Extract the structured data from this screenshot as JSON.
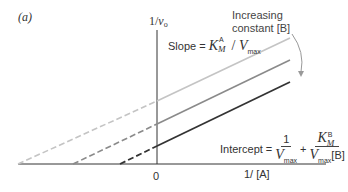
{
  "panel_label": "(a)",
  "axes": {
    "y_label_main": "1/",
    "y_label_var": "v",
    "y_label_sub": "o",
    "x_label": "1/ [A]",
    "origin_label": "0"
  },
  "annotation": {
    "line1": "Increasing",
    "line2": "constant [B]"
  },
  "slope": {
    "prefix": "Slope = ",
    "K": "K",
    "K_sup": "A",
    "K_sub": "M",
    "slash": " / ",
    "V": "V",
    "V_sub": "max"
  },
  "intercept": {
    "prefix": "Intercept = ",
    "frac1_num": "1",
    "frac1_den_V": "V",
    "frac1_den_sub": "max",
    "plus": "+",
    "frac2_num_K": "K",
    "frac2_num_sup": "B",
    "frac2_num_sub": "M",
    "frac2_den_V": "V",
    "frac2_den_sub": "max",
    "frac2_den_tail": "[B]"
  },
  "lines": [
    {
      "name": "low-B",
      "color": "#bdbdbd"
    },
    {
      "name": "mid-B",
      "color": "#8a8a8a"
    },
    {
      "name": "high-B",
      "color": "#333333"
    }
  ]
}
